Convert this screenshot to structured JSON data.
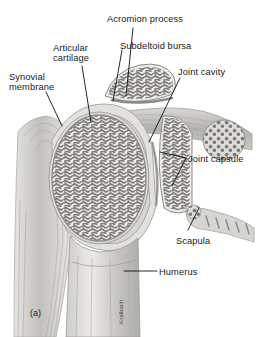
{
  "figure": {
    "number": "(a)",
    "artist_signature": "Kralbach"
  },
  "labels": [
    {
      "id": "acromion-process",
      "text": "Acromion process",
      "x": 107,
      "y": 14,
      "align": "left"
    },
    {
      "id": "subdeltoid-bursa",
      "text": "Subdeltoid bursa",
      "x": 120,
      "y": 41,
      "align": "left"
    },
    {
      "id": "articular-cartilage",
      "text": "Articular\ncartilage",
      "x": 53,
      "y": 43,
      "align": "left"
    },
    {
      "id": "synovial-membrane",
      "text": "Synovial\nmembrane",
      "x": 9,
      "y": 72,
      "align": "left"
    },
    {
      "id": "joint-cavity",
      "text": "Joint cavity",
      "x": 178,
      "y": 67,
      "align": "left"
    },
    {
      "id": "joint-capsule",
      "text": "Joint capsule",
      "x": 188,
      "y": 154,
      "align": "left"
    },
    {
      "id": "scapula",
      "text": "Scapula",
      "x": 176,
      "y": 236,
      "align": "left"
    },
    {
      "id": "humerus",
      "text": "Humerus",
      "x": 159,
      "y": 267,
      "align": "left"
    }
  ],
  "colors": {
    "background": "#ffffff",
    "label_text": "#1a1a1a",
    "leader_line": "#111111",
    "bone_cortical": "#e8e6e2",
    "bone_trabecular": "#8f8d8a",
    "cartilage": "#d9d7d3",
    "muscle": "#bcbab6",
    "capsule": "#cfcdc9"
  },
  "anatomy_parts": [
    "acromion",
    "subdeltoid bursa",
    "articular cartilage",
    "synovial membrane",
    "joint cavity",
    "joint capsule",
    "scapula",
    "humerus",
    "deltoid muscle"
  ]
}
